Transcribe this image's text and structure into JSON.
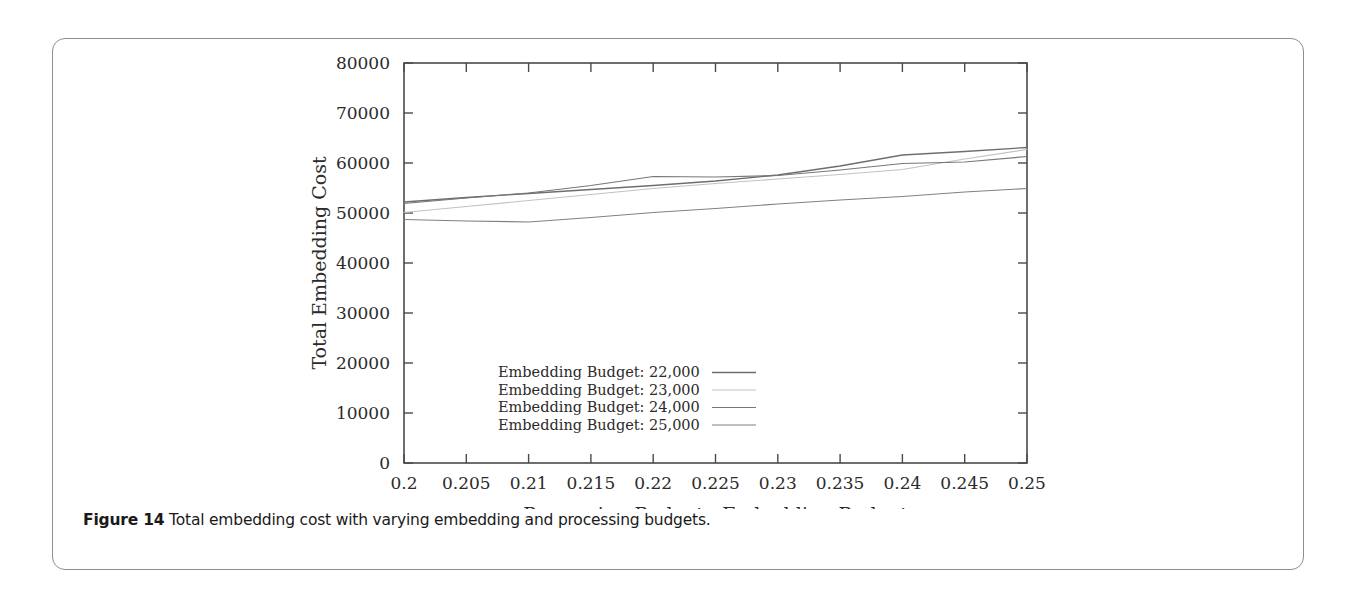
{
  "figure": {
    "caption_label": "Figure 14",
    "caption_text": "Total embedding cost with varying embedding and processing budgets."
  },
  "chart_data": {
    "type": "line",
    "title": "",
    "xlabel": "Processing Budget : Embedding Budget",
    "ylabel": "Total Embedding Cost",
    "xlim": [
      0.2,
      0.25
    ],
    "ylim": [
      0,
      80000
    ],
    "grid": false,
    "legend_position": "inside-bottom-right",
    "xticks": [
      "0.2",
      "0.205",
      "0.21",
      "0.215",
      "0.22",
      "0.225",
      "0.23",
      "0.235",
      "0.24",
      "0.245",
      "0.25"
    ],
    "xtick_values": [
      0.2,
      0.205,
      0.21,
      0.215,
      0.22,
      0.225,
      0.23,
      0.235,
      0.24,
      0.245,
      0.25
    ],
    "yticks": [
      "0",
      "10000",
      "20000",
      "30000",
      "40000",
      "50000",
      "60000",
      "70000",
      "80000"
    ],
    "ytick_values": [
      0,
      10000,
      20000,
      30000,
      40000,
      50000,
      60000,
      70000,
      80000
    ],
    "x": [
      0.2,
      0.205,
      0.21,
      0.215,
      0.22,
      0.225,
      0.23,
      0.235,
      0.24,
      0.245,
      0.25
    ],
    "series": [
      {
        "name": "Embedding Budget: 22,000",
        "color": "#6e6e6e",
        "width": 1.3,
        "values": [
          52200,
          53100,
          53900,
          54700,
          55500,
          56400,
          57600,
          59400,
          61600,
          62300,
          63100
        ]
      },
      {
        "name": "Embedding Budget: 23,000",
        "color": "#c2c2c2",
        "width": 1.2,
        "values": [
          50100,
          51300,
          52500,
          53700,
          54900,
          55900,
          56800,
          57700,
          58700,
          60800,
          62700
        ]
      },
      {
        "name": "Embedding Budget: 24,000",
        "color": "#777777",
        "width": 1.2,
        "values": [
          51900,
          53000,
          54000,
          55500,
          57300,
          57200,
          57500,
          58600,
          59900,
          60200,
          61300
        ]
      },
      {
        "name": "Embedding Budget: 25,000",
        "color": "#808080",
        "width": 1.2,
        "values": [
          48700,
          48400,
          48200,
          49100,
          50100,
          50900,
          51800,
          52600,
          53300,
          54200,
          54900
        ]
      }
    ]
  },
  "legend": {
    "entries": [
      "Embedding Budget: 22,000",
      "Embedding Budget: 23,000",
      "Embedding Budget: 24,000",
      "Embedding Budget: 25,000"
    ]
  },
  "colors": {
    "frame": "#4a4a4a",
    "card_border": "#8d8f92",
    "text": "#2b2b2b",
    "caption": "#1a1a1a"
  }
}
